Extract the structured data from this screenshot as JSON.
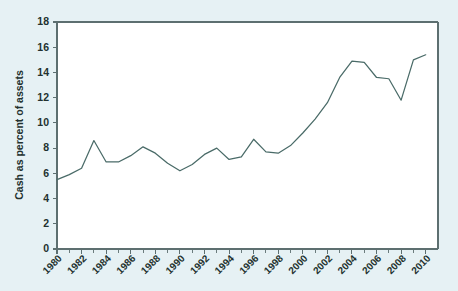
{
  "chart_data": {
    "type": "line",
    "title": "",
    "xlabel": "",
    "ylabel": "Cash as percent of assets",
    "xlim": [
      1980,
      2011
    ],
    "ylim": [
      0,
      18
    ],
    "ytick_step": 2,
    "xtick_step": 2,
    "minor_xticks": true,
    "grid": false,
    "legend": "none",
    "line_color": "#4a6b68",
    "plot_background": "#ffffff",
    "figure_background": "#e6f1f4",
    "yticks": [
      0,
      2,
      4,
      6,
      8,
      10,
      12,
      14,
      16,
      18
    ],
    "ytick_labels": [
      "0",
      "2",
      "4",
      "6",
      "8",
      "10",
      "12",
      "14",
      "16",
      "18"
    ],
    "xticks": [
      1980,
      1982,
      1984,
      1986,
      1988,
      1990,
      1992,
      1994,
      1996,
      1998,
      2000,
      2002,
      2004,
      2006,
      2008,
      2010
    ],
    "xtick_labels": [
      "1980",
      "1982",
      "1984",
      "1986",
      "1988",
      "1990",
      "1992",
      "1994",
      "1996",
      "1998",
      "2000",
      "2002",
      "2004",
      "2006",
      "2008",
      "2010"
    ],
    "x": [
      1980,
      1981,
      1982,
      1983,
      1984,
      1985,
      1986,
      1987,
      1988,
      1989,
      1990,
      1991,
      1992,
      1993,
      1994,
      1995,
      1996,
      1997,
      1998,
      1999,
      2000,
      2001,
      2002,
      2003,
      2004,
      2005,
      2006,
      2007,
      2008,
      2009,
      2010
    ],
    "values": [
      5.5,
      5.9,
      6.4,
      8.6,
      6.9,
      6.9,
      7.4,
      8.1,
      7.6,
      6.8,
      6.2,
      6.7,
      7.5,
      8.0,
      7.1,
      7.3,
      8.7,
      7.7,
      7.6,
      8.2,
      9.2,
      10.3,
      11.6,
      13.6,
      14.9,
      14.8,
      13.6,
      13.5,
      11.8,
      15.0,
      15.4
    ],
    "series_name": "Cash as percent of assets"
  }
}
